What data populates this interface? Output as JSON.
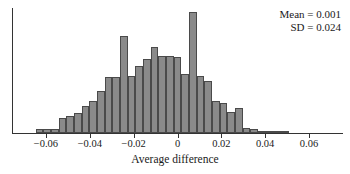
{
  "chart_data": {
    "type": "bar",
    "title": "",
    "subtitle": "",
    "xlabel": "Average difference",
    "ylabel": "",
    "grid": false,
    "legend": null,
    "xlim": [
      -0.0755,
      0.0755
    ],
    "ylim": [
      0,
      100
    ],
    "xticks": [
      -0.06,
      -0.04,
      -0.02,
      0,
      0.02,
      0.04,
      0.06
    ],
    "xticklabels": [
      "−0.06",
      "−0.04",
      "−0.02",
      "0",
      "0.02",
      "0.04",
      "0.06"
    ],
    "bin_width": 0.0035,
    "categories": [
      "-0.0665",
      "-0.063",
      "-0.0595",
      "-0.056",
      "-0.0525",
      "-0.049",
      "-0.0455",
      "-0.042",
      "-0.0385",
      "-0.035",
      "-0.0315",
      "-0.028",
      "-0.0245",
      "-0.021",
      "-0.0175",
      "-0.014",
      "-0.0105",
      "-0.007",
      "-0.0035",
      "0",
      "0.0035",
      "0.007",
      "0.0105",
      "0.014",
      "0.0175",
      "0.021",
      "0.0245",
      "0.028",
      "0.0315",
      "0.035",
      "0.0385",
      "0.042",
      "0.0455",
      "0.049",
      "0.0525",
      "0.056",
      "0.0595",
      "0.063",
      "0.0665",
      "0.07"
    ],
    "values": [
      0,
      3,
      3,
      3,
      12,
      14,
      16,
      22,
      26,
      34,
      45,
      45,
      78,
      46,
      54,
      59,
      69,
      62,
      62,
      61,
      47,
      97,
      46,
      42,
      26,
      24,
      17,
      20,
      4,
      3,
      2,
      2,
      1,
      1,
      0,
      0,
      0,
      0,
      0,
      0
    ],
    "annotations": [
      {
        "text": "Mean = 0.001",
        "position": "top-right"
      },
      {
        "text": "SD = 0.024",
        "position": "top-right"
      }
    ],
    "colors": {
      "bar_fill": "#8a8a8a",
      "bar_edge": "#4a4a4a",
      "axis": "#333333",
      "text": "#1a1a1a",
      "background": "#ffffff"
    }
  },
  "annotation": {
    "mean_text": "Mean = 0.001",
    "sd_text": "SD = 0.024"
  },
  "axis": {
    "xlabel": "Average difference"
  }
}
